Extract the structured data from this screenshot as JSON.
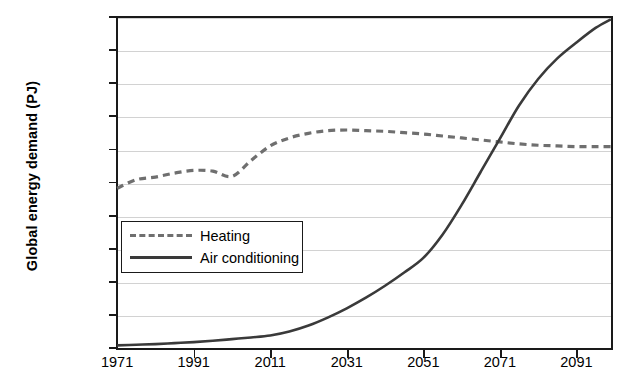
{
  "chart_data": {
    "type": "line",
    "title": "",
    "xlabel": "",
    "ylabel": "Global energy demand (PJ)",
    "xlim": [
      1971,
      2100
    ],
    "ylim": [
      0,
      50000
    ],
    "grid": true,
    "legend_position": "inside-left",
    "x_ticks": [
      1971,
      1991,
      2011,
      2031,
      2051,
      2071,
      2091
    ],
    "x_tick_labels": [
      "1971",
      "1991",
      "2011",
      "2031",
      "2051",
      "2071",
      "2091"
    ],
    "y_ticks": [
      0,
      5000,
      10000,
      15000,
      20000,
      25000,
      30000,
      35000,
      40000,
      45000,
      50000
    ],
    "y_tick_labels": [
      "0",
      "5000",
      "10000",
      "15000",
      "20000",
      "25000",
      "30000",
      "35000",
      "40000",
      "45000",
      "50000"
    ],
    "x": [
      1971,
      1976,
      1981,
      1986,
      1991,
      1996,
      2001,
      2006,
      2011,
      2016,
      2021,
      2026,
      2031,
      2036,
      2041,
      2046,
      2051,
      2056,
      2061,
      2066,
      2071,
      2076,
      2081,
      2086,
      2091,
      2096,
      2100
    ],
    "series": [
      {
        "name": "Heating",
        "style": "dashed",
        "color": "#6f6f6f",
        "values": [
          24000,
          25300,
          25700,
          26300,
          26700,
          26600,
          25800,
          28200,
          30400,
          31600,
          32300,
          32700,
          32800,
          32700,
          32600,
          32400,
          32200,
          31900,
          31600,
          31300,
          31000,
          30700,
          30500,
          30400,
          30300,
          30300,
          30300
        ]
      },
      {
        "name": "Air conditioning",
        "style": "solid",
        "color": "#3a3a3a",
        "values": [
          300,
          400,
          500,
          650,
          800,
          1000,
          1250,
          1500,
          1800,
          2400,
          3300,
          4500,
          5900,
          7500,
          9300,
          11300,
          13500,
          17000,
          21500,
          26500,
          31500,
          36500,
          40500,
          43600,
          46000,
          48200,
          49500
        ]
      }
    ],
    "annotations": []
  },
  "legend": {
    "items": [
      {
        "label": "Heating"
      },
      {
        "label": "Air conditioning"
      }
    ]
  }
}
